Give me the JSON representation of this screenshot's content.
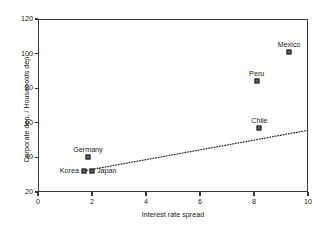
{
  "chart_data": {
    "type": "scatter",
    "title": "",
    "xlabel": "Interest rate spread",
    "ylabel": "Corporate dep. / Households dep.",
    "xlim": [
      0,
      10
    ],
    "ylim": [
      20,
      120
    ],
    "xticks": [
      0,
      2,
      4,
      6,
      8,
      10
    ],
    "yticks": [
      20,
      40,
      60,
      80,
      100,
      120
    ],
    "xtick_labels": [
      "0",
      "2",
      "4",
      "6",
      "8",
      "10"
    ],
    "ytick_labels": [
      "20",
      "40",
      "60",
      "80",
      "100",
      "120"
    ],
    "grid": false,
    "legend": "none",
    "marker_style": "filled-square",
    "marker_color": "#5e5e5e",
    "points": [
      {
        "label": "Mexico",
        "x": 9.3,
        "y": 101,
        "label_pos": "above"
      },
      {
        "label": "Peru",
        "x": 8.1,
        "y": 84,
        "label_pos": "above"
      },
      {
        "label": "Chile",
        "x": 8.2,
        "y": 57,
        "label_pos": "above"
      },
      {
        "label": "Germany",
        "x": 1.85,
        "y": 40,
        "label_pos": "above"
      },
      {
        "label": "Korea",
        "x": 1.7,
        "y": 32,
        "label_pos": "left"
      },
      {
        "label": "Japan",
        "x": 2.0,
        "y": 32,
        "label_pos": "right"
      }
    ],
    "trendline": {
      "type": "dotted-linear",
      "x_start": 1.8,
      "y_start": 32.5,
      "x_end": 17.2,
      "y_end": 76.0,
      "color": "#2b2b2b"
    }
  }
}
